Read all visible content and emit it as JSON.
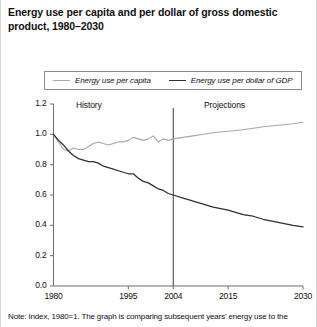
{
  "figure": {
    "title": "Energy use per capita and per dollar of gross domestic product, 1980–2030",
    "note": "Note: Index, 1980=1. The graph is comparing subsequent years' energy use to the"
  },
  "legend": {
    "items": [
      {
        "label": "Energy use per capita",
        "color": "#a8a8a8",
        "swatch": "line-swatch"
      },
      {
        "label": "Energy use per dollar of GDP",
        "color": "#2f2f2f",
        "swatch": "line-swatch"
      }
    ]
  },
  "annotations": {
    "history": "History",
    "projections": "Projections"
  },
  "chart_data": {
    "type": "line",
    "title": "Energy use per capita and per dollar of gross domestic product, 1980–2030",
    "xlabel": "",
    "ylabel": "",
    "xlim": [
      1980,
      2030
    ],
    "ylim": [
      0.0,
      1.2
    ],
    "grid": false,
    "legend_position": "top",
    "xticks": [
      1980,
      1995,
      2004,
      2015,
      2030
    ],
    "xtick_labels": [
      "1980",
      "1995",
      "2004",
      "2015",
      "2030"
    ],
    "yticks": [
      0.0,
      0.2,
      0.4,
      0.6,
      0.8,
      1.0,
      1.2
    ],
    "ytick_labels": [
      "0.0",
      "0.2",
      "0.4",
      "0.6",
      "0.8",
      "1.0",
      "1.2"
    ],
    "divider_x": 2004,
    "divider_label_left": "History",
    "divider_label_right": "Projections",
    "x": [
      1980,
      1981,
      1982,
      1983,
      1984,
      1985,
      1986,
      1987,
      1988,
      1989,
      1990,
      1991,
      1992,
      1993,
      1994,
      1995,
      1996,
      1997,
      1998,
      1999,
      2000,
      2001,
      2002,
      2003,
      2004,
      2006,
      2008,
      2010,
      2012,
      2015,
      2018,
      2020,
      2022,
      2025,
      2028,
      2030
    ],
    "series": [
      {
        "name": "Energy use per capita",
        "color": "#a8a8a8",
        "values": [
          1.0,
          0.95,
          0.9,
          0.89,
          0.91,
          0.9,
          0.9,
          0.92,
          0.94,
          0.95,
          0.94,
          0.93,
          0.94,
          0.95,
          0.95,
          0.96,
          0.98,
          0.97,
          0.96,
          0.97,
          0.99,
          0.95,
          0.97,
          0.96,
          0.97,
          0.98,
          0.99,
          1.0,
          1.01,
          1.02,
          1.03,
          1.04,
          1.05,
          1.06,
          1.07,
          1.08
        ]
      },
      {
        "name": "Energy use per dollar of GDP",
        "color": "#2f2f2f",
        "values": [
          1.0,
          0.96,
          0.93,
          0.89,
          0.86,
          0.84,
          0.83,
          0.82,
          0.82,
          0.81,
          0.79,
          0.78,
          0.77,
          0.76,
          0.75,
          0.74,
          0.74,
          0.71,
          0.69,
          0.68,
          0.66,
          0.64,
          0.63,
          0.61,
          0.6,
          0.58,
          0.56,
          0.54,
          0.52,
          0.5,
          0.47,
          0.46,
          0.44,
          0.42,
          0.4,
          0.39
        ]
      }
    ]
  }
}
